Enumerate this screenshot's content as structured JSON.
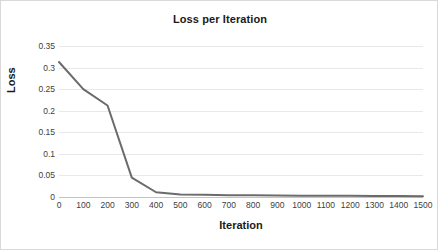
{
  "chart_data": {
    "type": "line",
    "title": "Loss per Iteration",
    "xlabel": "Iteration",
    "ylabel": "Loss",
    "x": [
      0,
      100,
      200,
      300,
      400,
      500,
      600,
      700,
      800,
      900,
      1000,
      1100,
      1200,
      1300,
      1400,
      1500
    ],
    "values": [
      0.313,
      0.25,
      0.212,
      0.045,
      0.011,
      0.006,
      0.005,
      0.004,
      0.004,
      0.0035,
      0.003,
      0.003,
      0.0028,
      0.0025,
      0.0022,
      0.002
    ],
    "series": [
      {
        "name": "Loss",
        "values": [
          0.313,
          0.25,
          0.212,
          0.045,
          0.011,
          0.006,
          0.005,
          0.004,
          0.004,
          0.0035,
          0.003,
          0.003,
          0.0028,
          0.0025,
          0.0022,
          0.002
        ]
      }
    ],
    "xlim": [
      0,
      1500
    ],
    "ylim": [
      0,
      0.35
    ],
    "xticks": [
      0,
      100,
      200,
      300,
      400,
      500,
      600,
      700,
      800,
      900,
      1000,
      1100,
      1200,
      1300,
      1400,
      1500
    ],
    "xtick_labels": [
      "0",
      "100",
      "200",
      "300",
      "400",
      "500",
      "600",
      "700",
      "800",
      "900",
      "1000",
      "1100",
      "1200",
      "1300",
      "1400",
      "1500"
    ],
    "yticks": [
      0,
      0.05,
      0.1,
      0.15,
      0.2,
      0.25,
      0.3,
      0.35
    ],
    "ytick_labels": [
      "0",
      "0.05",
      "0.1",
      "0.15",
      "0.2",
      "0.25",
      "0.3",
      "0.35"
    ],
    "grid": "horizontal",
    "legend": "none",
    "line_color": "#6b6b6b",
    "line_width": 2,
    "plot_background": "#ffffff",
    "gridline_color": "#e8e8e8",
    "border_color": "#d9d9d9"
  }
}
